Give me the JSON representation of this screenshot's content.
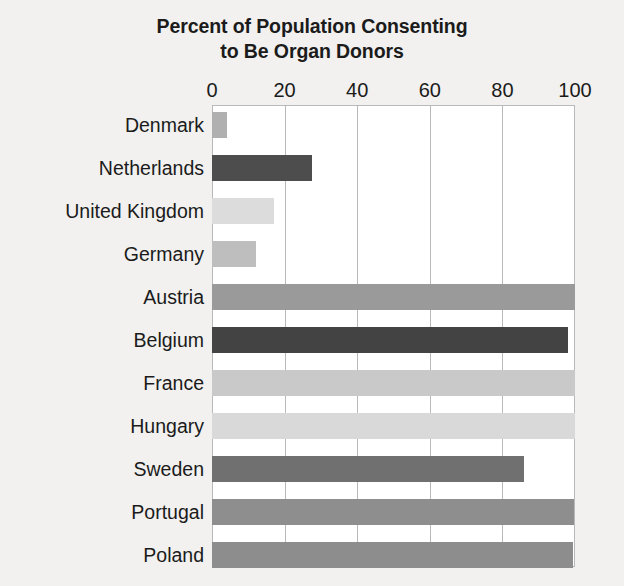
{
  "chart_data": {
    "type": "bar",
    "orientation": "horizontal",
    "title": "Percent of Population Consenting to Be Organ Donors",
    "title_lines": [
      "Percent of Population Consenting",
      "to Be Organ Donors"
    ],
    "xlabel": "",
    "ylabel": "",
    "xlim": [
      0,
      100
    ],
    "xticks": [
      0,
      20,
      40,
      60,
      80,
      100
    ],
    "xtick_labels": [
      "0",
      "20",
      "40",
      "60",
      "80",
      "100"
    ],
    "grid": true,
    "grid_axis": "x",
    "legend": false,
    "axis_position": "top",
    "categories": [
      "Denmark",
      "Netherlands",
      "United Kingdom",
      "Germany",
      "Austria",
      "Belgium",
      "France",
      "Hungary",
      "Sweden",
      "Portugal",
      "Poland"
    ],
    "values": [
      4.25,
      27.5,
      17.17,
      12,
      99.98,
      98,
      99.91,
      99.97,
      85.9,
      99.64,
      99.5
    ],
    "bars": [
      {
        "category": "Denmark",
        "value": 4.25,
        "color": "#b0b0b0"
      },
      {
        "category": "Netherlands",
        "value": 27.5,
        "color": "#4d4d4d"
      },
      {
        "category": "United Kingdom",
        "value": 17.17,
        "color": "#dcdcdc"
      },
      {
        "category": "Germany",
        "value": 12.0,
        "color": "#bebebe"
      },
      {
        "category": "Austria",
        "value": 99.98,
        "color": "#9a9a9a"
      },
      {
        "category": "Belgium",
        "value": 98.0,
        "color": "#434343"
      },
      {
        "category": "France",
        "value": 99.91,
        "color": "#c9c9c9"
      },
      {
        "category": "Hungary",
        "value": 99.97,
        "color": "#d9d9d9"
      },
      {
        "category": "Sweden",
        "value": 85.9,
        "color": "#707070"
      },
      {
        "category": "Portugal",
        "value": 99.64,
        "color": "#8e8e8e"
      },
      {
        "category": "Poland",
        "value": 99.5,
        "color": "#8d8d8d"
      }
    ],
    "colors": {
      "background": "#f2f1ef",
      "plot_background": "#ffffff",
      "gridline": "#b9b9b9",
      "text": "#1b1b1b"
    }
  }
}
